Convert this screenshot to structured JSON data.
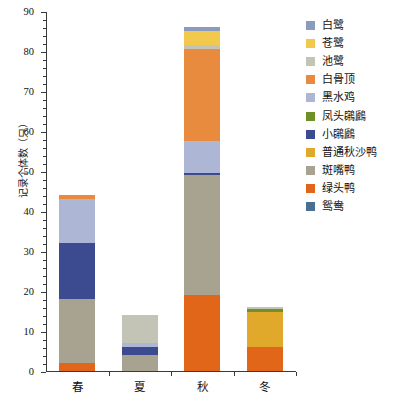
{
  "chart_data": {
    "type": "bar",
    "subtype": "stacked-vertical",
    "title": "",
    "xlabel": "",
    "ylabel": "记录个体数（只）",
    "ylim": [
      0,
      90
    ],
    "ytick_values": [
      0,
      10,
      20,
      30,
      40,
      50,
      60,
      70,
      80,
      90
    ],
    "ytick_labels": [
      "0",
      "10",
      "20",
      "30",
      "40",
      "50",
      "60",
      "70",
      "80",
      "90"
    ],
    "yminor_step": 2,
    "grid": false,
    "legend_position": "right",
    "categories": [
      "春",
      "夏",
      "秋",
      "冬"
    ],
    "series": [
      {
        "name": "白鹭",
        "color": "#8b9bbd",
        "values": [
          0,
          0,
          1,
          0
        ]
      },
      {
        "name": "苍鹭",
        "color": "#f2c94c",
        "values": [
          0,
          0,
          3.5,
          0
        ]
      },
      {
        "name": "池鹭",
        "color": "#c3c3b6",
        "values": [
          0,
          7,
          1,
          0.6
        ]
      },
      {
        "name": "白骨顶",
        "color": "#e88b3f",
        "values": [
          1,
          0,
          23,
          0
        ]
      },
      {
        "name": "黑水鸡",
        "color": "#aeb6d6",
        "values": [
          11,
          1,
          8,
          0
        ]
      },
      {
        "name": "凤头鸊鷉",
        "color": "#6f8f28",
        "values": [
          0,
          0,
          0,
          0.7
        ]
      },
      {
        "name": "小鸊鷉",
        "color": "#3c4a8f",
        "values": [
          14,
          2,
          0.6,
          0
        ]
      },
      {
        "name": "普通秋沙鸭",
        "color": "#e0a92b",
        "values": [
          0,
          0,
          0,
          8.7
        ]
      },
      {
        "name": "斑嘴鸭",
        "color": "#a8a390",
        "values": [
          16,
          4,
          30,
          0
        ]
      },
      {
        "name": "绿头鸭",
        "color": "#e2661a",
        "values": [
          2,
          0,
          19,
          6
        ]
      },
      {
        "name": "鸳鸯",
        "color": "#4a6f93",
        "values": [
          0,
          0,
          0,
          0
        ]
      }
    ],
    "totals": [
      44,
      14,
      86.5,
      16
    ],
    "stack_order_bottom_to_top": [
      "鸳鸯",
      "绿头鸭",
      "斑嘴鸭",
      "普通秋沙鸭",
      "小鸊鷉",
      "凤头鸊鷉",
      "黑水鸡",
      "白骨顶",
      "池鹭",
      "苍鹭",
      "白鹭"
    ]
  },
  "legend": {
    "items": [
      {
        "label": "白鹭",
        "swatch": "#8b9bbd"
      },
      {
        "label": "苍鹭",
        "swatch": "#f2c94c"
      },
      {
        "label": "池鹭",
        "swatch": "#c3c3b6"
      },
      {
        "label": "白骨顶",
        "swatch": "#e88b3f"
      },
      {
        "label": "黑水鸡",
        "swatch": "#aeb6d6"
      },
      {
        "label": "凤头鸊鷉",
        "swatch": "#6f8f28"
      },
      {
        "label": "小鸊鷉",
        "swatch": "#3c4a8f"
      },
      {
        "label": "普通秋沙鸭",
        "swatch": "#e0a92b"
      },
      {
        "label": "斑嘴鸭",
        "swatch": "#a8a390"
      },
      {
        "label": "绿头鸭",
        "swatch": "#e2661a"
      },
      {
        "label": "鸳鸯",
        "swatch": "#4a6f93"
      }
    ]
  }
}
